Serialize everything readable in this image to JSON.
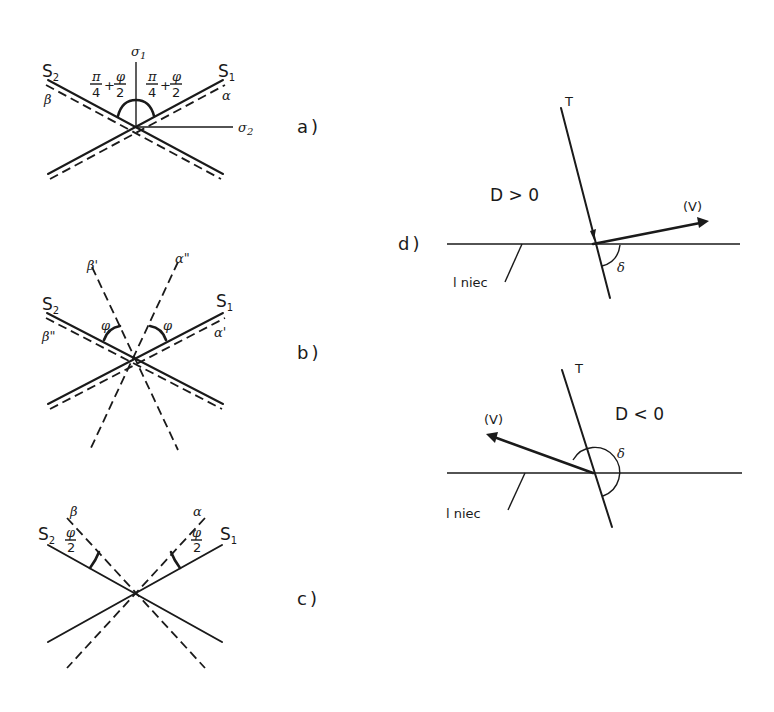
{
  "panels": {
    "a": {
      "label": "a)",
      "S1": "S",
      "S1_sub": "1",
      "S2": "S",
      "S2_sub": "2",
      "sigma1": "σ",
      "sigma1_sub": "1",
      "sigma2": "σ",
      "sigma2_sub": "2",
      "alpha": "α",
      "beta": "β",
      "angle_left": {
        "num1": "π",
        "den1": "4",
        "plus": "+",
        "num2": "φ",
        "den2": "2"
      },
      "angle_right": {
        "num1": "π",
        "den1": "4",
        "plus": "+",
        "num2": "φ",
        "den2": "2"
      }
    },
    "b": {
      "label": "b)",
      "S1": "S",
      "S1_sub": "1",
      "S2": "S",
      "S2_sub": "2",
      "beta_prime": "β'",
      "alpha_dprime": "α\"",
      "beta_dprime": "β\"",
      "alpha_prime": "α'",
      "phi_left": "φ",
      "phi_right": "φ"
    },
    "c": {
      "label": "c)",
      "S1": "S",
      "S1_sub": "1",
      "S2": "S",
      "S2_sub": "2",
      "alpha": "α",
      "beta": "β",
      "half_phi_left": {
        "num": "φ",
        "den": "2"
      },
      "half_phi_right": {
        "num": "φ",
        "den": "2"
      }
    },
    "d": {
      "label": "d)",
      "upper": {
        "T": "T",
        "V": "(V)",
        "condition": "D > 0",
        "delta": "δ",
        "fault": "l niec"
      },
      "lower": {
        "T": "T",
        "V": "(V)",
        "condition": "D < 0",
        "delta": "δ",
        "fault": "l niec"
      }
    }
  }
}
